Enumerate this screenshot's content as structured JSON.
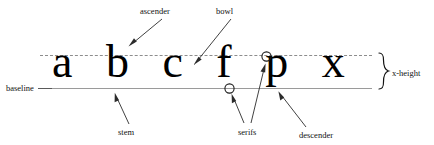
{
  "diagram": {
    "background_color": "#ffffff",
    "width": 434,
    "height": 145
  },
  "specimen": {
    "letters": "a b c f p x",
    "color": "#000000"
  },
  "guides": [
    {
      "name": "x-height",
      "style": "dashed",
      "color": "#8d8d8d",
      "y": 55
    },
    {
      "name": "baseline",
      "style": "solid",
      "color": "#9a9a9a",
      "y": 88
    }
  ],
  "labels": {
    "baseline": "baseline",
    "ascender": "ascender",
    "bowl": "bowl",
    "stem": "stem",
    "serifs": "serifs",
    "descender": "descender",
    "x_height": "x-height"
  },
  "markers": {
    "serif_circle_count": 2,
    "brace": "}"
  }
}
